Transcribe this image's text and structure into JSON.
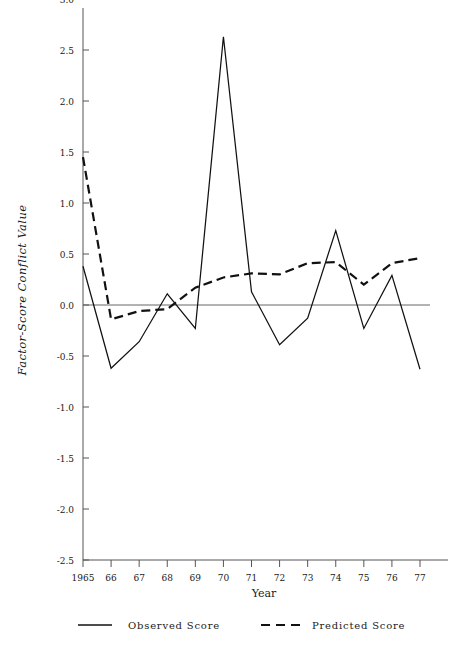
{
  "chart_data": {
    "type": "line",
    "title": "",
    "xlabel": "Year",
    "ylabel": "Factor-Score Conflict Value",
    "x": [
      1965,
      1966,
      1967,
      1968,
      1969,
      1970,
      1971,
      1972,
      1973,
      1974,
      1975,
      1976,
      1977
    ],
    "xticklabels": [
      "1965",
      "66",
      "67",
      "68",
      "69",
      "70",
      "71",
      "72",
      "73",
      "74",
      "75",
      "76",
      "77"
    ],
    "yticklabels": [
      "3.0",
      "2.5",
      "2.0",
      "1.5",
      "1.0",
      "0.5",
      "0.0",
      "-0.5",
      "-1.0",
      "-1.5",
      "-2.0",
      "-2.5"
    ],
    "yticks": [
      3.0,
      2.5,
      2.0,
      1.5,
      1.0,
      0.5,
      0.0,
      -0.5,
      -1.0,
      -1.5,
      -2.0,
      -2.5
    ],
    "ylim": [
      -2.9,
      3.25
    ],
    "xlim": [
      1965,
      1977
    ],
    "grid": false,
    "zero_line": true,
    "legend_position": "below-axes",
    "series": [
      {
        "name": "Observed Score",
        "style": "solid",
        "color": "#111111",
        "values": [
          0.38,
          -0.62,
          -0.36,
          0.11,
          -0.23,
          2.63,
          0.13,
          -0.39,
          -0.13,
          0.73,
          -0.23,
          0.29,
          -0.63
        ]
      },
      {
        "name": "Predicted Score",
        "style": "dashed",
        "color": "#111111",
        "values": [
          1.45,
          -0.14,
          -0.06,
          -0.04,
          0.17,
          0.27,
          0.31,
          0.3,
          0.41,
          0.42,
          0.2,
          0.41,
          0.46
        ]
      }
    ]
  },
  "axes": {
    "y_axis_title": "Factor-Score Conflict Value",
    "x_axis_title": "Year"
  },
  "legend": {
    "entries": [
      {
        "label": "Observed Score",
        "style": "solid"
      },
      {
        "label": "Predicted Score",
        "style": "dashed"
      }
    ]
  }
}
